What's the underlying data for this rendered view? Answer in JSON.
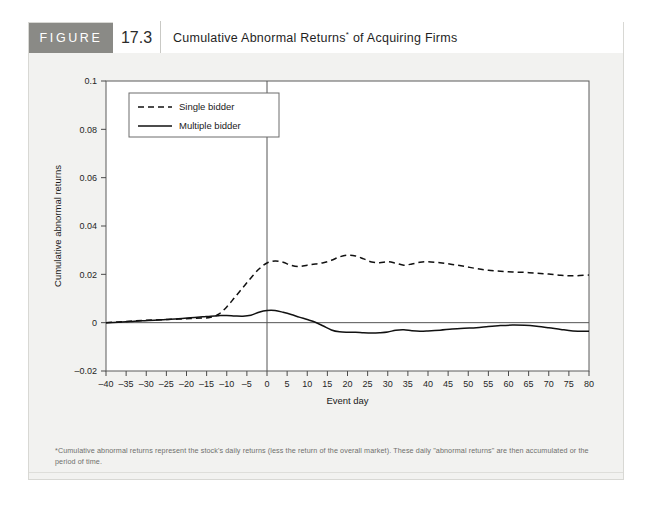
{
  "figure": {
    "tag": "FIGURE",
    "number": "17.3",
    "title": "Cumulative Abnormal Returns",
    "title_marker": "*",
    "title_suffix": " of Acquiring Firms",
    "footnote": "*Cumulative abnormal returns represent the stock's daily returns (less the return of the overall market). These daily \"abnormal returns\" are then accumulated or the period of time.",
    "tag_background": "#8a8a86",
    "panel_background": "#f2f2f0"
  },
  "chart_data": {
    "type": "line",
    "xlabel": "Event day",
    "ylabel": "Cumulative abnormal returns",
    "xlim": [
      -40,
      80
    ],
    "ylim": [
      -0.02,
      0.1
    ],
    "xticks": [
      -40,
      -35,
      -30,
      -25,
      -20,
      -15,
      -10,
      -5,
      0,
      5,
      10,
      15,
      20,
      25,
      30,
      35,
      40,
      45,
      50,
      55,
      60,
      65,
      70,
      75,
      80
    ],
    "xtick_labels": [
      "–40",
      "–35",
      "–30",
      "–25",
      "–20",
      "–15",
      "–10",
      "–5",
      "0",
      "5",
      "10",
      "15",
      "20",
      "25",
      "30",
      "35",
      "40",
      "45",
      "50",
      "55",
      "60",
      "65",
      "70",
      "75",
      "80"
    ],
    "yticks": [
      -0.02,
      0,
      0.02,
      0.04,
      0.06,
      0.08,
      0.1
    ],
    "ytick_labels": [
      "–0.02",
      "0",
      "0.02",
      "0.04",
      "0.06",
      "0.08",
      "0.1"
    ],
    "grid": false,
    "legend_position": "top-left",
    "event_marker_x": 0,
    "x": [
      -40,
      -37,
      -34,
      -31,
      -28,
      -25,
      -22,
      -19,
      -16,
      -14,
      -12,
      -10,
      -8,
      -6,
      -4,
      -2,
      0,
      2,
      4,
      6,
      8,
      10,
      12,
      14,
      16,
      18,
      20,
      22,
      24,
      26,
      28,
      30,
      32,
      34,
      36,
      38,
      40,
      43,
      46,
      49,
      52,
      55,
      58,
      61,
      64,
      67,
      70,
      73,
      76,
      80
    ],
    "series": [
      {
        "name": "Single bidder",
        "style": "dashed",
        "color": "#111111",
        "values": [
          0.0,
          0.0003,
          0.0006,
          0.0009,
          0.0011,
          0.0013,
          0.0015,
          0.0017,
          0.0019,
          0.0022,
          0.0035,
          0.0065,
          0.0105,
          0.0145,
          0.0185,
          0.0222,
          0.0247,
          0.0255,
          0.025,
          0.0237,
          0.0232,
          0.0238,
          0.0243,
          0.0248,
          0.0258,
          0.0272,
          0.0279,
          0.0276,
          0.0264,
          0.0251,
          0.0248,
          0.0252,
          0.0246,
          0.0238,
          0.0243,
          0.025,
          0.0252,
          0.0248,
          0.0241,
          0.0233,
          0.0224,
          0.0217,
          0.0213,
          0.021,
          0.0208,
          0.0205,
          0.0201,
          0.0196,
          0.0194,
          0.0197
        ]
      },
      {
        "name": "Multiple bidder",
        "style": "solid",
        "color": "#111111",
        "values": [
          0.0,
          0.0002,
          0.0005,
          0.0008,
          0.001,
          0.0013,
          0.0016,
          0.002,
          0.0024,
          0.0027,
          0.0029,
          0.003,
          0.0028,
          0.0027,
          0.0031,
          0.0043,
          0.005,
          0.005,
          0.0043,
          0.0034,
          0.0023,
          0.0013,
          0.0002,
          -0.0014,
          -0.003,
          -0.0038,
          -0.004,
          -0.004,
          -0.0042,
          -0.0043,
          -0.0042,
          -0.0039,
          -0.0031,
          -0.0029,
          -0.0033,
          -0.0035,
          -0.0034,
          -0.0031,
          -0.0026,
          -0.0023,
          -0.0021,
          -0.0016,
          -0.0012,
          -0.001,
          -0.0011,
          -0.0015,
          -0.0021,
          -0.0028,
          -0.0034,
          -0.0036
        ]
      }
    ]
  }
}
